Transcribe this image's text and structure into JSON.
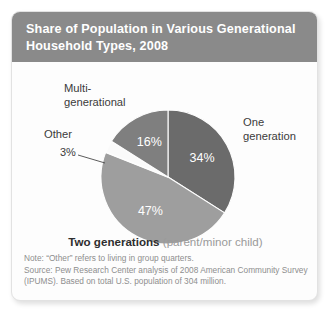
{
  "chart_data": {
    "type": "pie",
    "title": "Share of Population in Various Generational Household Types, 2008",
    "xlabel": "",
    "ylabel": "",
    "grid": false,
    "legend_position": "callout-labels",
    "units": "percent of U.S. population",
    "categories": [
      "One generation",
      "Two generations (parent/minor child)",
      "Other",
      "Multi-generational"
    ],
    "values": [
      34,
      47,
      3,
      16
    ],
    "data_labels": [
      "34%",
      "47%",
      "3%",
      "16%"
    ],
    "slices": [
      {
        "label": "One generation",
        "label_lines": "One\ngeneration",
        "value": 34,
        "data_label": "34%",
        "color": "#6b6b6b",
        "start_angle_deg": 0,
        "end_angle_deg": 122.4
      },
      {
        "label": "Two generations",
        "sublabel": "(parent/minor child)",
        "value": 47,
        "data_label": "47%",
        "color": "#9e9e9e",
        "start_angle_deg": 122.4,
        "end_angle_deg": 291.6
      },
      {
        "label": "Other",
        "value": 3,
        "data_label": "3%",
        "color": "#fafafa",
        "start_angle_deg": 291.6,
        "end_angle_deg": 302.4
      },
      {
        "label": "Multi-generational",
        "label_lines": "Multi-\ngenerational",
        "value": 16,
        "data_label": "16%",
        "color": "#7f7f7f",
        "start_angle_deg": 302.4,
        "end_angle_deg": 360
      }
    ],
    "total_percent": 100,
    "population_basis": "304 million"
  },
  "title": {
    "text": "Share of Population in Various Generational Household Types, 2008",
    "band_color": "#8a8a8a",
    "text_color": "#ffffff"
  },
  "labels": {
    "multi_generational": "Multi-\ngenerational",
    "other": "Other",
    "other_pct": "3%",
    "one_generation": "One\ngeneration",
    "two_generations_main": "Two generations ",
    "two_generations_sub": "(parent/minor child)",
    "pct_one": "34%",
    "pct_two": "47%",
    "pct_multi": "16%"
  },
  "footnote": {
    "line1": "Note: “Other” refers to living in group quarters.",
    "line2": "Source: Pew Research Center analysis of 2008 American Community Survey",
    "line3": "(IPUMS). Based on total U.S. population of 304 million."
  },
  "colors": {
    "slice_one_generation": "#6b6b6b",
    "slice_two_generations": "#9e9e9e",
    "slice_other": "#fafafa",
    "slice_multi_generational": "#7f7f7f",
    "title_band": "#8a8a8a",
    "card_background": "#fdfdfd",
    "footnote_text": "#8e8e8e"
  }
}
